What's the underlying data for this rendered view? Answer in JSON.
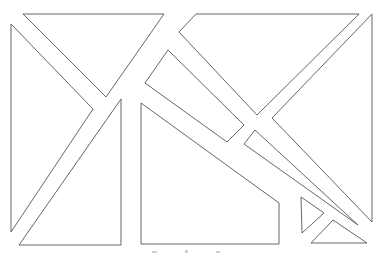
{
  "diagram": {
    "type": "tangram-style dissection of a rectangle",
    "background": "#ffffff",
    "stroke_color": "#555555",
    "pieces": [
      {
        "id": "top-left-triangle",
        "points": "23,14 164,14 106,97"
      },
      {
        "id": "left-triangle",
        "points": "11,24 93,109 11,232"
      },
      {
        "id": "lower-left-triangle",
        "points": "121,99 121,245 19,245"
      },
      {
        "id": "lower-middle-quadrilateral",
        "points": "141,103 279,203 279,244 141,244"
      },
      {
        "id": "top-right-quadrilateral",
        "points": "196,14 359,14 257,115 179,32"
      },
      {
        "id": "middle-tilted-rectangle",
        "points": "168,50 244,125 227,142 145,83"
      },
      {
        "id": "right-triangle",
        "points": "372,14 272,118 372,222"
      },
      {
        "id": "narrow-wedge",
        "points": "255,130 244,144 358,225"
      },
      {
        "id": "small-triangle",
        "points": "301,197 324,213 302,233"
      },
      {
        "id": "bottom-right-triangle",
        "points": "333,220 311,243 367,243"
      }
    ],
    "caption_marks": [
      {
        "x": 152,
        "y": 251,
        "w": 5,
        "h": 2
      },
      {
        "x": 185,
        "y": 250,
        "w": 3,
        "h": 3
      },
      {
        "x": 216,
        "y": 251,
        "w": 4,
        "h": 2
      }
    ]
  }
}
